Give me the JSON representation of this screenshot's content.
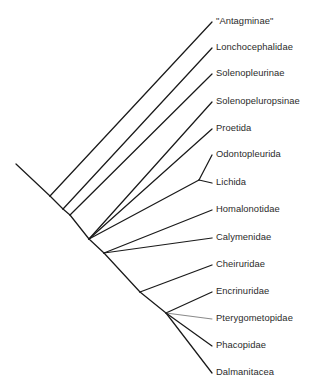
{
  "figure": {
    "type": "cladogram",
    "orientation": "diagonal-ladder",
    "background_color": "#ffffff",
    "line_color": "#1a1a1a",
    "accent_line_color": "#8a8a8a",
    "text_color": "#2b2b2b"
  },
  "chart_data": {
    "type": "diagram",
    "title": "",
    "taxa": [
      {
        "id": "antagminae",
        "label": "\"Antagminae\"",
        "tip_x": 212,
        "tip_y": 22,
        "label_x": 216,
        "label_y": 22
      },
      {
        "id": "lonchocephalidae",
        "label": "Lonchocephalidae",
        "tip_x": 212,
        "tip_y": 48,
        "label_x": 216,
        "label_y": 48
      },
      {
        "id": "solenopleurinae",
        "label": "Solenopleurinae",
        "tip_x": 212,
        "tip_y": 74,
        "label_x": 216,
        "label_y": 74
      },
      {
        "id": "solenopeluropsinae",
        "label": "Solenopeluropsinae",
        "tip_x": 212,
        "tip_y": 102,
        "label_x": 216,
        "label_y": 102
      },
      {
        "id": "proetida",
        "label": "Proetida",
        "tip_x": 212,
        "tip_y": 129,
        "label_x": 216,
        "label_y": 129
      },
      {
        "id": "odontopleurida",
        "label": "Odontopleurida",
        "tip_x": 212,
        "tip_y": 155,
        "label_x": 216,
        "label_y": 155
      },
      {
        "id": "lichida",
        "label": "Lichida",
        "tip_x": 212,
        "tip_y": 183,
        "label_x": 216,
        "label_y": 183
      },
      {
        "id": "homalonotidae",
        "label": "Homalonotidae",
        "tip_x": 212,
        "tip_y": 210,
        "label_x": 216,
        "label_y": 210
      },
      {
        "id": "calymenidae",
        "label": "Calymenidae",
        "tip_x": 212,
        "tip_y": 238,
        "label_x": 216,
        "label_y": 238
      },
      {
        "id": "cheiruridae",
        "label": "Cheiruridae",
        "tip_x": 212,
        "tip_y": 265,
        "label_x": 216,
        "label_y": 265
      },
      {
        "id": "encrinuridae",
        "label": "Encrinuridae",
        "tip_x": 212,
        "tip_y": 292,
        "label_x": 216,
        "label_y": 292
      },
      {
        "id": "pterygometopidae",
        "label": "Pterygometopidae",
        "tip_x": 212,
        "tip_y": 319,
        "label_x": 216,
        "label_y": 319
      },
      {
        "id": "phacopidae",
        "label": "Phacopidae",
        "tip_x": 212,
        "tip_y": 346,
        "label_x": 216,
        "label_y": 346
      },
      {
        "id": "dalmanitacea",
        "label": "Dalmanitacea",
        "tip_x": 212,
        "tip_y": 373,
        "label_x": 216,
        "label_y": 373
      }
    ],
    "nodes": [
      {
        "id": "root",
        "x": 16,
        "y": 164
      },
      {
        "id": "node-a",
        "x": 50,
        "y": 196
      },
      {
        "id": "node-b",
        "x": 63,
        "y": 209
      },
      {
        "id": "node-c",
        "x": 70,
        "y": 215
      },
      {
        "id": "node-d",
        "x": 89,
        "y": 239
      },
      {
        "id": "node-odon",
        "x": 199,
        "y": 180
      },
      {
        "id": "node-e",
        "x": 104,
        "y": 253
      },
      {
        "id": "node-f",
        "x": 140,
        "y": 292
      },
      {
        "id": "node-poly",
        "x": 166,
        "y": 313
      }
    ],
    "branches": [
      {
        "from": "root",
        "to": "node-a",
        "kind": "backbone"
      },
      {
        "from": "node-a",
        "to": "antagminae",
        "kind": "terminal"
      },
      {
        "from": "node-a",
        "to": "node-b",
        "kind": "backbone"
      },
      {
        "from": "node-b",
        "to": "lonchocephalidae",
        "kind": "terminal"
      },
      {
        "from": "node-b",
        "to": "node-c",
        "kind": "backbone"
      },
      {
        "from": "node-c",
        "to": "solenopleurinae",
        "kind": "terminal"
      },
      {
        "from": "node-c",
        "to": "node-d",
        "kind": "backbone"
      },
      {
        "from": "node-d",
        "to": "solenopeluropsinae",
        "kind": "terminal"
      },
      {
        "from": "node-d",
        "to": "proetida",
        "kind": "terminal"
      },
      {
        "from": "node-d",
        "to": "node-odon",
        "kind": "internal"
      },
      {
        "from": "node-odon",
        "to": "odontopleurida",
        "kind": "terminal"
      },
      {
        "from": "node-odon",
        "to": "lichida",
        "kind": "terminal"
      },
      {
        "from": "node-d",
        "to": "node-e",
        "kind": "backbone"
      },
      {
        "from": "node-e",
        "to": "homalonotidae",
        "kind": "terminal"
      },
      {
        "from": "node-e",
        "to": "calymenidae",
        "kind": "terminal"
      },
      {
        "from": "node-e",
        "to": "node-f",
        "kind": "backbone"
      },
      {
        "from": "node-f",
        "to": "cheiruridae",
        "kind": "terminal"
      },
      {
        "from": "node-f",
        "to": "node-poly",
        "kind": "backbone"
      },
      {
        "from": "node-poly",
        "to": "encrinuridae",
        "kind": "terminal"
      },
      {
        "from": "node-poly",
        "to": "pterygometopidae",
        "kind": "terminal-accent"
      },
      {
        "from": "node-poly",
        "to": "phacopidae",
        "kind": "terminal"
      },
      {
        "from": "node-poly",
        "to": "dalmanitacea",
        "kind": "terminal"
      }
    ]
  }
}
